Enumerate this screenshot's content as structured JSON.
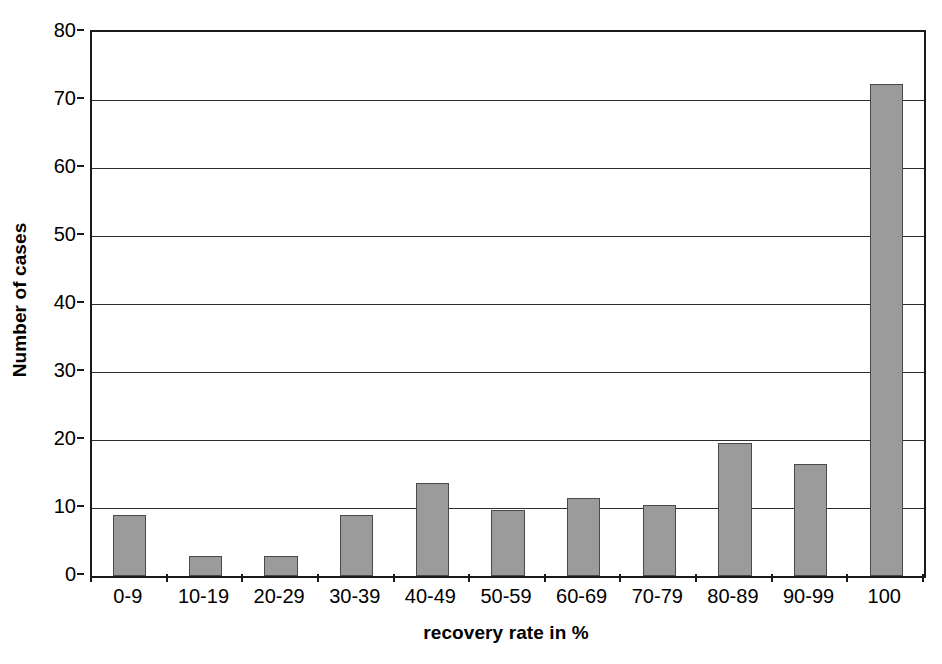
{
  "chart_data": {
    "type": "bar",
    "title": "",
    "xlabel": "recovery rate in %",
    "ylabel": "Number of cases",
    "categories": [
      "0-9",
      "10-19",
      "20-29",
      "30-39",
      "40-49",
      "50-59",
      "60-69",
      "70-79",
      "80-89",
      "90-99",
      "100"
    ],
    "values": [
      9,
      3,
      3,
      9,
      13.7,
      9.7,
      11.5,
      10.5,
      19.5,
      16.5,
      72.3
    ],
    "ylim": [
      0,
      80
    ],
    "yticks": [
      0,
      10,
      20,
      30,
      40,
      50,
      60,
      70,
      80
    ],
    "grid": true,
    "legend": null,
    "bar_color": "#9b9b9b",
    "bar_border_color": "#4a4a4a",
    "axis_color": "#1a1a1a",
    "gridline_color": "#2b2b2b",
    "background": "#ffffff"
  }
}
